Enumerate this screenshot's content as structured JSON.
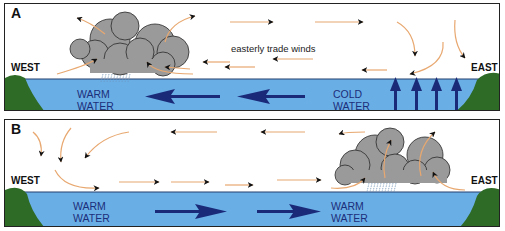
{
  "colors": {
    "water": "#6aaee6",
    "water_border": "#24406e",
    "land": "#2e6b26",
    "cloud": "#9a9a9a",
    "cloud_edge": "#2a2a2a",
    "wind": "#e8a870",
    "current_arrow": "#1a2a78",
    "label_text": "#1c2f7a"
  },
  "panels": [
    {
      "id": "A",
      "label": "A",
      "west_label": "WEST",
      "east_label": "EAST",
      "annotation": "easterly trade winds",
      "water_labels": [
        {
          "line1": "WARM",
          "line2": "WATER"
        },
        {
          "line1": "COLD",
          "line2": "WATER"
        }
      ],
      "cloud_position": "west",
      "current_direction": "westward",
      "upwelling": "east"
    },
    {
      "id": "B",
      "label": "B",
      "west_label": "WEST",
      "east_label": "EAST",
      "water_labels": [
        {
          "line1": "WARM",
          "line2": "WATER"
        },
        {
          "line1": "WARM",
          "line2": "WATER"
        }
      ],
      "cloud_position": "east",
      "current_direction": "eastward",
      "upwelling": "none"
    }
  ]
}
